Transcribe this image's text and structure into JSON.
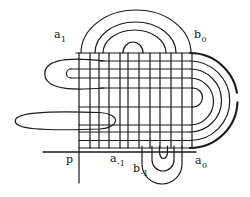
{
  "figure": {
    "line_color": "#1a1a1a",
    "background": "#ffffff",
    "labels": {
      "a1": {
        "base": "a",
        "sub": "1"
      },
      "b0": {
        "base": "b",
        "sub": "0"
      },
      "p": {
        "base": "p",
        "sub": ""
      },
      "a_m1": {
        "base": "a",
        "sub": "-1"
      },
      "b_m1": {
        "base": "b",
        "sub": "-1"
      },
      "a0": {
        "base": "a",
        "sub": "0"
      }
    }
  }
}
